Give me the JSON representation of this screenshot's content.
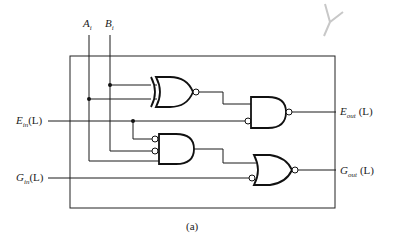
{
  "diagram": {
    "caption": "(a)",
    "inputs": {
      "a": {
        "main": "A",
        "sub": "i"
      },
      "b": {
        "main": "B",
        "sub": "i"
      },
      "e_in": {
        "main": "E",
        "sub": "in",
        "suffix": "(L)"
      },
      "g_in": {
        "main": "G",
        "sub": "in",
        "suffix": "(L)"
      }
    },
    "outputs": {
      "e_out": {
        "main": "E",
        "sub": "out",
        "suffix": "(L)"
      },
      "g_out": {
        "main": "G",
        "sub": "out",
        "suffix": "(L)"
      }
    },
    "gates": [
      {
        "id": "xnor",
        "type": "XNOR"
      },
      {
        "id": "nand-e",
        "type": "AND with inverted input and output"
      },
      {
        "id": "and-mid",
        "type": "AND with two inverted inputs"
      },
      {
        "id": "nor-g",
        "type": "OR with inverted input and output"
      }
    ]
  }
}
